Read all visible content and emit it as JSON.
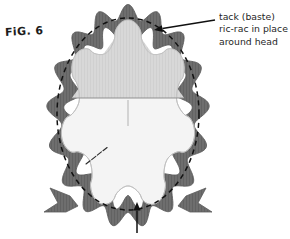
{
  "figure": {
    "label": "FiG. 6",
    "kind": "sewing-instruction-diagram"
  },
  "callout": {
    "lines": [
      "tack (baste)",
      "ric-rac in place",
      "around head"
    ],
    "leader_from": [
      215,
      20
    ],
    "leader_to": [
      154,
      30
    ]
  },
  "bottom_callout": {
    "caption": "",
    "arrow_from": [
      137,
      233
    ],
    "arrow_to": [
      137,
      202
    ]
  },
  "colors": {
    "ricrac": "#6e6e6e",
    "ricrac_shade": "#5e5e5e",
    "upper_panel": "#d6d6d6",
    "lower_panel": "#f4f4f4",
    "outline": "#9a9a9a",
    "baste_dash": "#121212",
    "ink": "#1f1f1f",
    "background": "#ffffff"
  },
  "geometry": {
    "ricrac_ring": {
      "center": [
        128,
        116
      ],
      "radius_x": 74,
      "radius_y": 104,
      "band_width": 17,
      "scallop_count": 17
    },
    "baste_oval": {
      "center": [
        128,
        114
      ],
      "radius_x": 71,
      "radius_y": 96,
      "dash": "5 4"
    },
    "star_panel": {
      "center": [
        128,
        116
      ],
      "points": 7
    },
    "seam_line_y": 98,
    "center_line": {
      "x": 128,
      "y1": 100,
      "y2": 126
    }
  },
  "stitch_marks": {
    "count": 4,
    "origin": [
      86,
      164
    ],
    "angle_deg": -38
  }
}
